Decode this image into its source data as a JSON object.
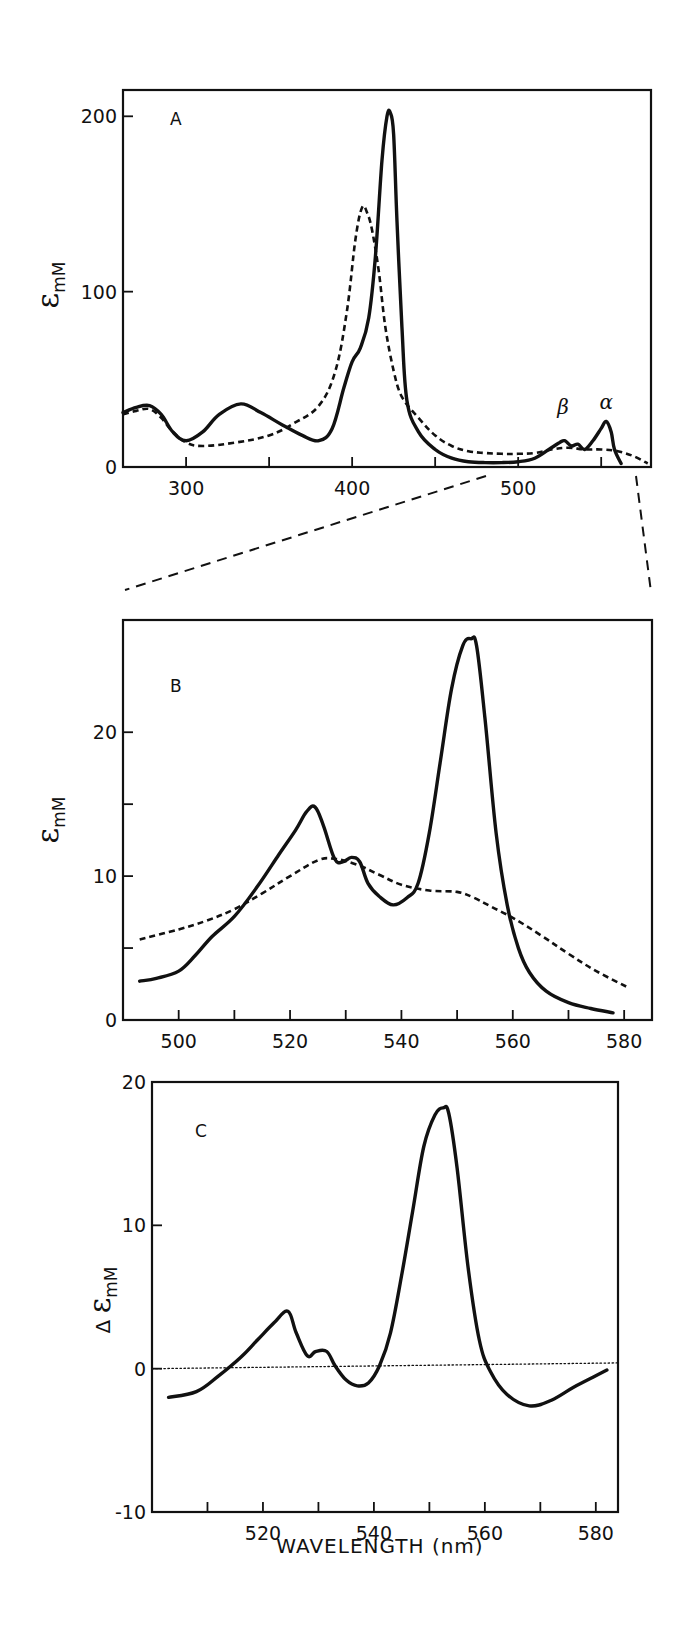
{
  "figure": {
    "x_axis_title": "WAVELENGTH (nm)",
    "annotations": {
      "beta": "β",
      "alpha": "α"
    }
  },
  "chart_data": [
    {
      "type": "line",
      "panel": "A",
      "title": "A",
      "xlabel": "",
      "ylabel": "εmM",
      "ylabel_parts": {
        "symbol": "ε",
        "subscript": "mM"
      },
      "xlim": [
        262,
        580
      ],
      "ylim": [
        0,
        215
      ],
      "xticks": [
        300,
        350,
        400,
        450,
        500,
        550
      ],
      "xtick_labels": [
        "300",
        "400",
        "500"
      ],
      "xtick_label_values": [
        300,
        400,
        500
      ],
      "yticks": [
        0,
        100,
        200
      ],
      "ytick_labels": [
        "0",
        "100",
        "200"
      ],
      "grid": false,
      "annotations": [
        {
          "text": "β",
          "x": 527,
          "y": 30
        },
        {
          "text": "α",
          "x": 553,
          "y": 33
        }
      ],
      "series": [
        {
          "name": "solid",
          "style": "solid",
          "x": [
            262,
            270,
            278,
            285,
            292,
            300,
            310,
            320,
            333,
            345,
            358,
            370,
            380,
            388,
            395,
            400,
            405,
            410,
            414,
            418,
            421,
            423,
            425,
            427,
            430,
            433,
            440,
            450,
            460,
            470,
            480,
            490,
            500,
            510,
            520,
            525,
            528,
            532,
            536,
            540,
            545,
            550,
            553,
            556,
            558,
            562
          ],
          "values": [
            31,
            34,
            35,
            30,
            20,
            15,
            20,
            30,
            36,
            31,
            24,
            18,
            15,
            22,
            45,
            60,
            68,
            85,
            120,
            175,
            200,
            202,
            190,
            140,
            80,
            38,
            20,
            10,
            5,
            3,
            2.5,
            2.5,
            3,
            5,
            11,
            14,
            15,
            12,
            13,
            10,
            15,
            22,
            26,
            20,
            10,
            2
          ]
        },
        {
          "name": "dashed",
          "style": "dashed",
          "x": [
            262,
            270,
            278,
            285,
            292,
            300,
            310,
            330,
            350,
            365,
            380,
            390,
            397,
            402,
            406,
            409,
            412,
            416,
            420,
            425,
            430,
            440,
            450,
            460,
            470,
            480,
            490,
            500,
            510,
            520,
            530,
            540,
            550,
            560,
            570,
            578
          ],
          "values": [
            30,
            32,
            33,
            28,
            20,
            14,
            12,
            14,
            18,
            25,
            35,
            55,
            90,
            130,
            148,
            145,
            135,
            112,
            80,
            55,
            40,
            28,
            18,
            12,
            9,
            8,
            7.5,
            7.5,
            8,
            10,
            11,
            10,
            10,
            9,
            6,
            2
          ]
        }
      ]
    },
    {
      "type": "line",
      "panel": "B",
      "title": "B",
      "xlabel": "",
      "ylabel": "εmM",
      "ylabel_parts": {
        "symbol": "ε",
        "subscript": "mM"
      },
      "xlim": [
        490,
        585
      ],
      "ylim": [
        0,
        27.8
      ],
      "xticks": [
        500,
        510,
        520,
        530,
        540,
        550,
        560,
        570,
        580
      ],
      "xtick_labels": [
        "500",
        "520",
        "540",
        "560",
        "580"
      ],
      "xtick_label_values": [
        500,
        520,
        540,
        560,
        580
      ],
      "yticks": [
        0,
        5,
        10,
        15,
        20
      ],
      "ytick_labels": [
        "0",
        "10",
        "20"
      ],
      "ytick_label_values": [
        0,
        10,
        20
      ],
      "grid": false,
      "series": [
        {
          "name": "solid",
          "style": "solid",
          "x": [
            493,
            496,
            500,
            503,
            506,
            510,
            514,
            518,
            521,
            523,
            524.5,
            526,
            528,
            529.5,
            531,
            532.5,
            534,
            536,
            538.5,
            541,
            543,
            545,
            547,
            549,
            551,
            552.5,
            553.5,
            555,
            557,
            559,
            561,
            563,
            566,
            570,
            574,
            578
          ],
          "values": [
            2.7,
            2.9,
            3.4,
            4.5,
            5.8,
            7.2,
            9.2,
            11.5,
            13.2,
            14.5,
            14.8,
            13.5,
            11.2,
            11.0,
            11.3,
            11.0,
            9.5,
            8.6,
            8.0,
            8.5,
            9.5,
            13.0,
            18.0,
            23.0,
            26.0,
            26.5,
            26.0,
            21.0,
            13.0,
            8.0,
            5.0,
            3.3,
            2.0,
            1.2,
            0.8,
            0.5
          ]
        },
        {
          "name": "dashed",
          "style": "dashed",
          "x": [
            493,
            500,
            505,
            510,
            515,
            520,
            525,
            528,
            532,
            536,
            540,
            545,
            550,
            553,
            556,
            560,
            565,
            570,
            575,
            581
          ],
          "values": [
            5.6,
            6.3,
            6.9,
            7.7,
            8.8,
            10.0,
            11.1,
            11.2,
            10.8,
            10.1,
            9.4,
            9.0,
            8.9,
            8.5,
            7.9,
            7.1,
            5.9,
            4.6,
            3.4,
            2.2
          ]
        }
      ]
    },
    {
      "type": "line",
      "panel": "C",
      "title": "C",
      "xlabel": "WAVELENGTH (nm)",
      "ylabel": "Δ εmM",
      "ylabel_parts": {
        "prefix": "Δ",
        "symbol": "ε",
        "subscript": "mM"
      },
      "xlim": [
        500,
        584
      ],
      "ylim": [
        -10,
        20
      ],
      "xticks": [
        510,
        520,
        530,
        540,
        550,
        560,
        570,
        580
      ],
      "xtick_labels": [
        "520",
        "540",
        "560",
        "580"
      ],
      "xtick_label_values": [
        520,
        540,
        560,
        580
      ],
      "yticks": [
        -10,
        0,
        10,
        20
      ],
      "ytick_labels": [
        "-10",
        "0",
        "10",
        "20"
      ],
      "grid": false,
      "series": [
        {
          "name": "difference",
          "style": "solid",
          "x": [
            503,
            508,
            512,
            516,
            519,
            522,
            524.5,
            526,
            528,
            529.5,
            531.5,
            533,
            535,
            537,
            539,
            541,
            543,
            545,
            547,
            549,
            551,
            552.5,
            553.5,
            555,
            557,
            559,
            561,
            564,
            568,
            572,
            576,
            580,
            582
          ],
          "values": [
            -2.0,
            -1.6,
            -0.5,
            0.8,
            2.0,
            3.2,
            4.0,
            2.5,
            0.9,
            1.2,
            1.2,
            0.2,
            -0.8,
            -1.2,
            -1.0,
            0.2,
            2.5,
            6.5,
            11.0,
            15.5,
            17.7,
            18.2,
            17.8,
            14.0,
            7.0,
            2.0,
            -0.2,
            -1.8,
            -2.6,
            -2.2,
            -1.3,
            -0.5,
            -0.1
          ]
        },
        {
          "name": "zero-baseline",
          "style": "dotted",
          "x": [
            500,
            584
          ],
          "values": [
            0.0,
            0.4
          ]
        }
      ]
    }
  ]
}
